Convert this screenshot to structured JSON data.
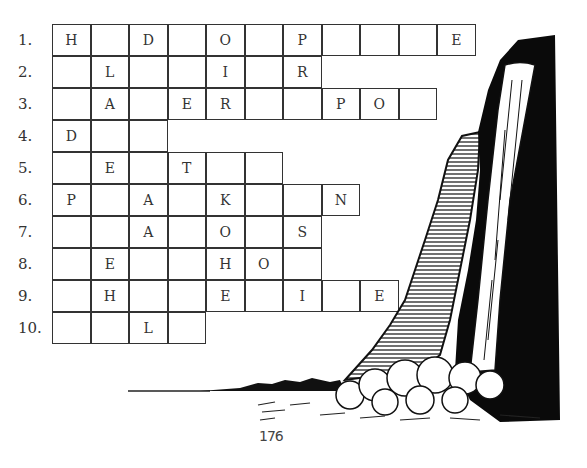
{
  "puzzle": {
    "rows": [
      {
        "label": "1.",
        "cells": [
          "H",
          "",
          "D",
          "",
          "O",
          "",
          "P",
          "",
          "",
          "",
          "E"
        ]
      },
      {
        "label": "2.",
        "cells": [
          "",
          "L",
          "",
          "",
          "I",
          "",
          "R"
        ]
      },
      {
        "label": "3.",
        "cells": [
          "",
          "A",
          "",
          "E",
          "R",
          "",
          "",
          "P",
          "O",
          ""
        ]
      },
      {
        "label": "4.",
        "cells": [
          "D",
          "",
          ""
        ]
      },
      {
        "label": "5.",
        "cells": [
          "",
          "E",
          "",
          "T",
          "",
          ""
        ]
      },
      {
        "label": "6.",
        "cells": [
          "P",
          "",
          "A",
          "",
          "K",
          "",
          "",
          "N"
        ]
      },
      {
        "label": "7.",
        "cells": [
          "",
          "",
          "A",
          "",
          "O",
          "",
          "S"
        ]
      },
      {
        "label": "8.",
        "cells": [
          "",
          "E",
          "",
          "",
          "H",
          "O",
          ""
        ]
      },
      {
        "label": "9.",
        "cells": [
          "",
          "H",
          "",
          "",
          "E",
          "",
          "I",
          "",
          "E"
        ]
      },
      {
        "label": "10.",
        "cells": [
          "",
          "",
          "L",
          ""
        ]
      }
    ]
  },
  "illustration": {
    "subject": "waterfall-icon"
  },
  "footer": {
    "page_number": "176"
  }
}
